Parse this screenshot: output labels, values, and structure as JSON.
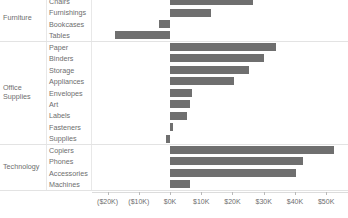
{
  "chart_data": {
    "type": "bar",
    "orientation": "horizontal",
    "title": "",
    "xlabel": "",
    "ylabel": "",
    "xlim": [
      -25000,
      57000
    ],
    "grid": false,
    "legend": false,
    "bar_color": "#6f6f6f",
    "axis_ticks": [
      {
        "label": "($20K)",
        "value": -20000
      },
      {
        "label": "($10K)",
        "value": -10000
      },
      {
        "label": "$0K",
        "value": 0
      },
      {
        "label": "$10K",
        "value": 10000
      },
      {
        "label": "$20K",
        "value": 20000
      },
      {
        "label": "$30K",
        "value": 30000
      },
      {
        "label": "$40K",
        "value": 40000
      },
      {
        "label": "$50K",
        "value": 50000
      }
    ],
    "groups": [
      {
        "name": "Furniture",
        "rows": [
          {
            "category": "Chairs",
            "value": 26590
          },
          {
            "category": "Furnishings",
            "value": 13060
          },
          {
            "category": "Bookcases",
            "value": -3470
          },
          {
            "category": "Tables",
            "value": -17730
          }
        ]
      },
      {
        "name": "Office Supplies",
        "rows": [
          {
            "category": "Paper",
            "value": 34050
          },
          {
            "category": "Binders",
            "value": 30220
          },
          {
            "category": "Storage",
            "value": 25170
          },
          {
            "category": "Appliances",
            "value": 20600
          },
          {
            "category": "Envelopes",
            "value": 6960
          },
          {
            "category": "Art",
            "value": 6530
          },
          {
            "category": "Labels",
            "value": 5550
          },
          {
            "category": "Fasteners",
            "value": 950
          },
          {
            "category": "Supplies",
            "value": -1190
          }
        ]
      },
      {
        "name": "Technology",
        "rows": [
          {
            "category": "Copiers",
            "value": 52520
          },
          {
            "category": "Phones",
            "value": 42660
          },
          {
            "category": "Accessories",
            "value": 40400
          },
          {
            "category": "Machines",
            "value": 6350
          }
        ]
      }
    ]
  }
}
